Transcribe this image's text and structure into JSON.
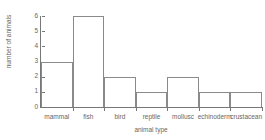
{
  "chart_data": {
    "type": "bar",
    "title": "",
    "subtitle": "",
    "xlabel": "animal type",
    "ylabel": "number of animals",
    "categories": [
      "mammal",
      "fish",
      "bird",
      "reptile",
      "mollusc",
      "echinoderm",
      "crustacean"
    ],
    "values": [
      3,
      6,
      2,
      1,
      2,
      1,
      1
    ],
    "ylim": [
      0,
      6
    ],
    "ytick_labels": [
      "0",
      "1",
      "2",
      "3",
      "4",
      "5",
      "6"
    ],
    "ytick_values": [
      0,
      1,
      2,
      3,
      4,
      5,
      6
    ],
    "grid": false,
    "legend": false,
    "bar_style": {
      "fill": "none",
      "edge_color": "#8a8a8a",
      "contiguous": true
    },
    "axis_color": "#777777",
    "text_color": "#666666",
    "background": "#ffffff"
  }
}
